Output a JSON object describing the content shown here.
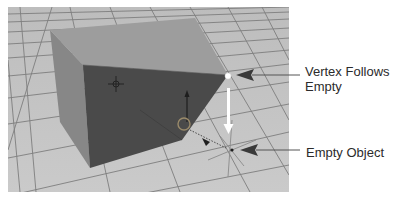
{
  "diagram": {
    "type": "annotated-3d-viewport-screenshot",
    "annotations": [
      {
        "id": "vertex",
        "line1": "Vertex Follows",
        "line2": "Empty"
      },
      {
        "id": "empty",
        "line1": "Empty Object"
      }
    ],
    "colors": {
      "floor": "#c2c2c2",
      "grid_line": "#7a7a7a",
      "cube_top": "#9a9a9a",
      "cube_side": "#8a8a8a",
      "cube_front_selected": "#4a4a4a",
      "vertex_dot": "#ffffff",
      "move_arrow": "#ffffff",
      "pointer_arrow": "#3a3a3a",
      "label_text": "#2b2b2b"
    }
  }
}
